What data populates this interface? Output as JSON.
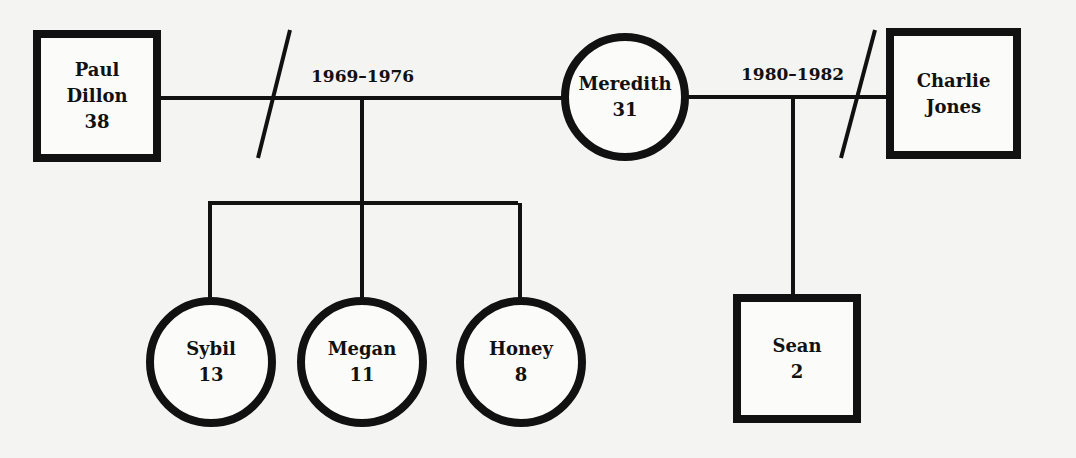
{
  "diagram_type": "genogram",
  "people": [
    {
      "id": "paul",
      "name_line1": "Paul",
      "name_line2": "Dillon",
      "age": "38",
      "sex": "male"
    },
    {
      "id": "meredith",
      "name_line1": "Meredith",
      "age": "31",
      "sex": "female"
    },
    {
      "id": "charlie",
      "name_line1": "Charlie",
      "name_line2": "Jones",
      "sex": "male"
    },
    {
      "id": "sybil",
      "name_line1": "Sybil",
      "age": "13",
      "sex": "female"
    },
    {
      "id": "megan",
      "name_line1": "Megan",
      "age": "11",
      "sex": "female"
    },
    {
      "id": "honey",
      "name_line1": "Honey",
      "age": "8",
      "sex": "female"
    },
    {
      "id": "sean",
      "name_line1": "Sean",
      "age": "2",
      "sex": "male"
    }
  ],
  "relationships": [
    {
      "id": "paul-meredith",
      "partners": [
        "paul",
        "meredith"
      ],
      "years": "1969–1976",
      "status": "divorced",
      "children": [
        "sybil",
        "megan",
        "honey"
      ]
    },
    {
      "id": "meredith-charlie",
      "partners": [
        "meredith",
        "charlie"
      ],
      "years": "1980–1982",
      "status": "divorced",
      "children": [
        "sean"
      ]
    }
  ]
}
